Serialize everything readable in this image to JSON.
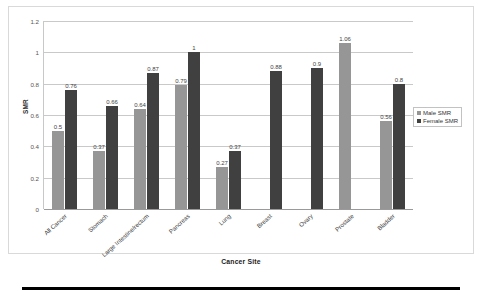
{
  "chart_data": {
    "type": "bar",
    "title": "",
    "xlabel": "Cancer Site",
    "ylabel": "SMR",
    "ylim": [
      0,
      1.2
    ],
    "ytick_labels": [
      "0",
      "0.2",
      "0.4",
      "0.6",
      "0.8",
      "1",
      "1.2"
    ],
    "ytick_values": [
      0,
      0.2,
      0.4,
      0.6,
      0.8,
      1,
      1.2
    ],
    "grid": true,
    "legend_position": "right",
    "categories": [
      "All Cancer",
      "Stomach",
      "Large Intestine/rectum",
      "Pancreas",
      "Lung",
      "Breast",
      "Ovary",
      "Prostate",
      "Bladder"
    ],
    "series": [
      {
        "name": "Male SMR",
        "color": "#969696",
        "values": [
          0.5,
          0.37,
          0.64,
          0.79,
          0.27,
          null,
          null,
          1.06,
          0.56
        ],
        "labels": [
          "0.5",
          "0.37",
          "0.64",
          "0.79",
          "0.27",
          "",
          "",
          "1.06",
          "0.56"
        ]
      },
      {
        "name": "Female SMR",
        "color": "#404040",
        "values": [
          0.76,
          0.66,
          0.87,
          1,
          0.37,
          0.88,
          0.9,
          null,
          0.8
        ],
        "labels": [
          "0.76",
          "0.66",
          "0.87",
          "1",
          "0.37",
          "0.88",
          "0.9",
          "",
          "0.8"
        ]
      }
    ]
  },
  "legend": {
    "items": [
      {
        "label": "Male SMR"
      },
      {
        "label": "Female SMR"
      }
    ]
  },
  "axes": {
    "y_title": "SMR",
    "x_title": "Cancer Site"
  }
}
